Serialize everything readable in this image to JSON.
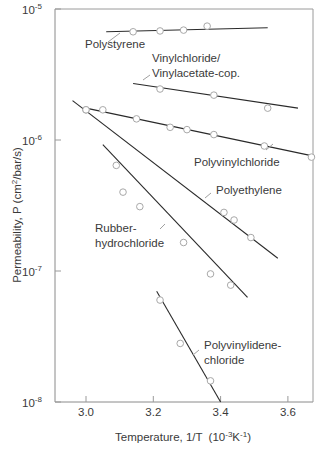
{
  "chart_data": {
    "type": "line",
    "title": "",
    "xlabel": "Temperature, 1/T",
    "xlabel_unit_prefix": "(10",
    "xlabel_unit_exp1": "-3",
    "xlabel_unit_mid": "K",
    "xlabel_unit_exp2": "-1",
    "xlabel_unit_suffix": ")",
    "ylabel": "Permeability, P (cm",
    "ylabel_exp": "2",
    "ylabel_suffix": "/bar/s)",
    "yscale": "log",
    "xlim": [
      2.91,
      3.68
    ],
    "ylim": [
      1e-08,
      1e-05
    ],
    "x_ticks": [
      "3.0",
      "3.2",
      "3.4",
      "3.6"
    ],
    "x_tick_values": [
      3.0,
      3.2,
      3.4,
      3.6
    ],
    "y_ticks": [
      {
        "base": "10",
        "exp": "-5",
        "value": 1e-05
      },
      {
        "base": "10",
        "exp": "-6",
        "value": 1e-06
      },
      {
        "base": "10",
        "exp": "-7",
        "value": 1e-07
      },
      {
        "base": "10",
        "exp": "-8",
        "value": 1e-08
      }
    ],
    "grid": false,
    "legend": "inline labels",
    "series": [
      {
        "name": "Polystyrene",
        "label_lines": [
          "Polystyrene"
        ],
        "fit_line": {
          "x": [
            3.06,
            3.54
          ],
          "y": [
            6.7e-06,
            7.2e-06
          ]
        },
        "points": [
          {
            "x": 3.14,
            "y": 6.7e-06
          },
          {
            "x": 3.22,
            "y": 6.8e-06
          },
          {
            "x": 3.29,
            "y": 6.9e-06
          },
          {
            "x": 3.36,
            "y": 7.4e-06
          }
        ]
      },
      {
        "name": "Vinylchloride/Vinylacetate-cop.",
        "label_lines": [
          "Vinylchloride/",
          "Vinylacetate-cop."
        ],
        "fit_line": {
          "x": [
            3.14,
            3.63
          ],
          "y": [
            2.7e-06,
            1.75e-06
          ]
        },
        "points": [
          {
            "x": 3.22,
            "y": 2.45e-06
          },
          {
            "x": 3.38,
            "y": 2.2e-06
          },
          {
            "x": 3.54,
            "y": 1.75e-06
          }
        ]
      },
      {
        "name": "Polyvinylchloride",
        "label_lines": [
          "Polyvinylchloride"
        ],
        "fit_line": {
          "x": [
            3.0,
            3.68
          ],
          "y": [
            1.75e-06,
            7.5e-07
          ]
        },
        "points": [
          {
            "x": 3.0,
            "y": 1.7e-06
          },
          {
            "x": 3.05,
            "y": 1.7e-06
          },
          {
            "x": 3.15,
            "y": 1.45e-06
          },
          {
            "x": 3.25,
            "y": 1.25e-06
          },
          {
            "x": 3.3,
            "y": 1.2e-06
          },
          {
            "x": 3.38,
            "y": 1.1e-06
          },
          {
            "x": 3.53,
            "y": 9e-07
          },
          {
            "x": 3.67,
            "y": 7.4e-07
          }
        ]
      },
      {
        "name": "Polyethylene",
        "label_lines": [
          "Polyethylene"
        ],
        "fit_line": {
          "x": [
            2.96,
            3.57
          ],
          "y": [
            2e-06,
            1.25e-07
          ]
        },
        "points": [
          {
            "x": 3.0,
            "y": 1.7e-06
          },
          {
            "x": 3.41,
            "y": 2.8e-07
          },
          {
            "x": 3.44,
            "y": 2.45e-07
          },
          {
            "x": 3.49,
            "y": 1.8e-07
          }
        ]
      },
      {
        "name": "Rubber-hydrochloride",
        "label_lines": [
          "Rubber-",
          "hydrochloride"
        ],
        "fit_line": {
          "x": [
            3.05,
            3.48
          ],
          "y": [
            9.2e-07,
            6.3e-08
          ]
        },
        "points": [
          {
            "x": 3.09,
            "y": 6.4e-07
          },
          {
            "x": 3.11,
            "y": 4e-07
          },
          {
            "x": 3.16,
            "y": 3.1e-07
          },
          {
            "x": 3.29,
            "y": 1.65e-07
          },
          {
            "x": 3.37,
            "y": 9.5e-08
          },
          {
            "x": 3.43,
            "y": 7.8e-08
          }
        ]
      },
      {
        "name": "Polyvinylidene-chloride",
        "label_lines": [
          "Polyvinylidene-",
          "chloride"
        ],
        "fit_line": {
          "x": [
            3.21,
            3.4
          ],
          "y": [
            7e-08,
            1e-08
          ]
        },
        "points": [
          {
            "x": 3.22,
            "y": 6e-08
          },
          {
            "x": 3.28,
            "y": 2.8e-08
          },
          {
            "x": 3.37,
            "y": 1.45e-08
          }
        ]
      }
    ]
  },
  "labels": {
    "polystyrene": {
      "lines": [
        "Polystyrene"
      ],
      "x": 85,
      "y": 48,
      "leader": [
        [
          108,
          42
        ],
        [
          120,
          33
        ]
      ]
    },
    "pvc_pvac": {
      "lines": [
        "Vinylchloride/",
        "Vinylacetate-cop."
      ],
      "x": 152,
      "y": 62,
      "leader": [
        [
          143,
          80
        ],
        [
          150,
          75
        ]
      ]
    },
    "pvc": {
      "lines": [
        "Polyvinylchloride"
      ],
      "x": 194,
      "y": 166,
      "leader": [
        [
          266,
          150
        ],
        [
          273,
          144
        ]
      ]
    },
    "pe": {
      "lines": [
        "Polyethylene"
      ],
      "x": 216,
      "y": 194,
      "leader": [
        [
          205,
          198
        ],
        [
          211,
          193
        ]
      ]
    },
    "rhc": {
      "lines": [
        "Rubber-",
        "hydrochloride"
      ],
      "x": 95,
      "y": 232,
      "leader": [
        [
          160,
          229
        ],
        [
          165,
          224
        ]
      ]
    },
    "pvdc": {
      "lines": [
        "Polyvinylidene-",
        "chloride"
      ],
      "x": 204,
      "y": 349,
      "leader": [
        [
          193,
          355
        ],
        [
          199,
          350
        ]
      ]
    }
  }
}
